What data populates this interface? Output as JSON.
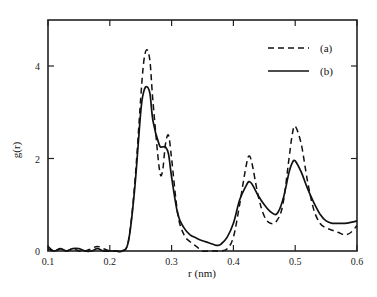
{
  "chart_data": {
    "type": "line",
    "title": "",
    "xlabel": "r (nm)",
    "ylabel": "g(r)",
    "xlim": [
      0.1,
      0.6
    ],
    "ylim": [
      0,
      5
    ],
    "x_ticks": [
      "0.1",
      "0.2",
      "0.3",
      "0.4",
      "0.5",
      "0.6"
    ],
    "y_ticks": [
      "0",
      "2",
      "4"
    ],
    "grid": false,
    "legend_position": "upper right",
    "series": [
      {
        "name": "(a)",
        "style": "dashed",
        "x": [
          0.1,
          0.11,
          0.12,
          0.13,
          0.14,
          0.15,
          0.16,
          0.17,
          0.18,
          0.19,
          0.2,
          0.21,
          0.22,
          0.23,
          0.24,
          0.25,
          0.255,
          0.26,
          0.265,
          0.27,
          0.28,
          0.285,
          0.29,
          0.295,
          0.3,
          0.31,
          0.32,
          0.33,
          0.34,
          0.35,
          0.36,
          0.37,
          0.38,
          0.39,
          0.4,
          0.41,
          0.42,
          0.425,
          0.43,
          0.44,
          0.45,
          0.46,
          0.47,
          0.48,
          0.49,
          0.495,
          0.5,
          0.51,
          0.52,
          0.53,
          0.54,
          0.55,
          0.56,
          0.57,
          0.58,
          0.59,
          0.6
        ],
        "y": [
          0.1,
          0.0,
          0.05,
          0.0,
          0.05,
          0.0,
          0.0,
          0.05,
          0.1,
          0.05,
          0.0,
          0.0,
          0.0,
          0.2,
          1.4,
          3.3,
          4.1,
          4.35,
          4.1,
          3.2,
          1.8,
          1.7,
          2.3,
          2.5,
          2.0,
          0.8,
          0.35,
          0.2,
          0.1,
          0.0,
          0.0,
          0.0,
          0.0,
          0.05,
          0.3,
          1.0,
          1.8,
          2.05,
          1.9,
          1.2,
          0.75,
          0.6,
          0.65,
          1.0,
          2.0,
          2.5,
          2.7,
          2.3,
          1.5,
          0.9,
          0.6,
          0.5,
          0.45,
          0.4,
          0.35,
          0.4,
          0.55
        ]
      },
      {
        "name": "(b)",
        "style": "solid",
        "x": [
          0.1,
          0.11,
          0.12,
          0.13,
          0.14,
          0.15,
          0.16,
          0.17,
          0.18,
          0.19,
          0.2,
          0.21,
          0.22,
          0.23,
          0.24,
          0.25,
          0.255,
          0.26,
          0.265,
          0.27,
          0.28,
          0.285,
          0.29,
          0.295,
          0.3,
          0.31,
          0.32,
          0.33,
          0.34,
          0.35,
          0.36,
          0.37,
          0.375,
          0.38,
          0.39,
          0.4,
          0.41,
          0.42,
          0.425,
          0.43,
          0.44,
          0.45,
          0.46,
          0.47,
          0.48,
          0.49,
          0.495,
          0.5,
          0.51,
          0.52,
          0.53,
          0.54,
          0.55,
          0.56,
          0.57,
          0.58,
          0.59,
          0.6
        ],
        "y": [
          0.05,
          0.0,
          0.05,
          0.0,
          0.05,
          0.05,
          0.0,
          0.0,
          0.05,
          0.0,
          0.0,
          0.0,
          0.0,
          0.2,
          1.3,
          3.0,
          3.45,
          3.55,
          3.4,
          2.8,
          2.3,
          2.25,
          2.25,
          2.1,
          1.6,
          0.8,
          0.5,
          0.35,
          0.28,
          0.22,
          0.18,
          0.13,
          0.12,
          0.15,
          0.3,
          0.6,
          1.1,
          1.4,
          1.5,
          1.45,
          1.2,
          1.0,
          0.85,
          0.8,
          1.1,
          1.7,
          1.9,
          1.95,
          1.7,
          1.35,
          1.05,
          0.8,
          0.65,
          0.6,
          0.6,
          0.6,
          0.62,
          0.65
        ]
      }
    ]
  },
  "legend": {
    "items": [
      {
        "label": "(a)",
        "style": "dashed"
      },
      {
        "label": "(b)",
        "style": "solid"
      }
    ]
  },
  "colors": {
    "line": "#111111",
    "axis": "#222222",
    "background": "#ffffff"
  }
}
